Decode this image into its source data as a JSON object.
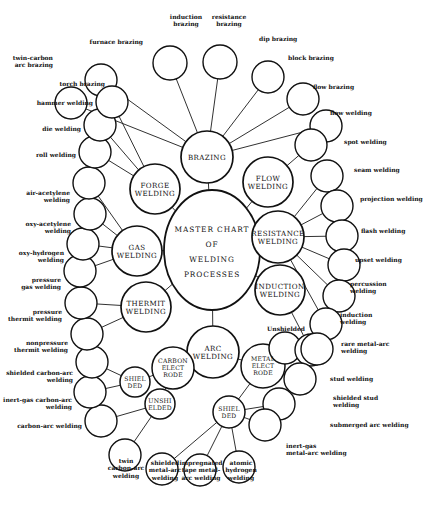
{
  "diagram": {
    "type": "radial-node-link",
    "background_color": "#ffffff",
    "line_color": "#111111",
    "text_color": "#111111"
  },
  "center": {
    "id": "center",
    "lines": [
      "MASTER CHART",
      "OF",
      "WELDING",
      "PROCESSES"
    ],
    "x": 212,
    "y": 250,
    "rx": 48,
    "ry": 60
  },
  "hubs": [
    {
      "id": "brazing",
      "lines": [
        "BRAZING"
      ],
      "x": 207,
      "y": 157,
      "r": 26
    },
    {
      "id": "flow",
      "lines": [
        "FLOW",
        "WELDING"
      ],
      "x": 268,
      "y": 182,
      "r": 25
    },
    {
      "id": "resistance",
      "lines": [
        "RESISTANCE",
        "WELDING"
      ],
      "x": 278,
      "y": 237,
      "r": 26
    },
    {
      "id": "induction",
      "lines": [
        "INDUCTION",
        "WELDING"
      ],
      "x": 280,
      "y": 290,
      "r": 25
    },
    {
      "id": "arc",
      "lines": [
        "ARC",
        "WELDING"
      ],
      "x": 213,
      "y": 352,
      "r": 26
    },
    {
      "id": "thermit",
      "lines": [
        "THERMIT",
        "WELDING"
      ],
      "x": 146,
      "y": 307,
      "r": 25
    },
    {
      "id": "gas",
      "lines": [
        "GAS",
        "WELDING"
      ],
      "x": 137,
      "y": 251,
      "r": 25
    },
    {
      "id": "forge",
      "lines": [
        "FORGE",
        "WELDING"
      ],
      "x": 155,
      "y": 189,
      "r": 25
    }
  ],
  "sub_hubs": [
    {
      "id": "carbon-electrode",
      "lines": [
        "CARBON",
        "ELECT",
        "RODE"
      ],
      "x": 173,
      "y": 368,
      "r": 21
    },
    {
      "id": "metal-electrode",
      "lines": [
        "METAL",
        "ELECT",
        "RODE"
      ],
      "x": 263,
      "y": 366,
      "r": 22
    },
    {
      "id": "shielded-carbon",
      "lines": [
        "SHIEL",
        "DED"
      ],
      "x": 135,
      "y": 382,
      "r": 15
    },
    {
      "id": "unshielded-carbon",
      "lines": [
        "UNSHI",
        "ELDED"
      ],
      "x": 160,
      "y": 404,
      "r": 15
    },
    {
      "id": "shielded-metal",
      "lines": [
        "SHIEL",
        "DED"
      ],
      "x": 229,
      "y": 412,
      "r": 16
    },
    {
      "id": "unshielded-metal",
      "lines": [],
      "x": 285,
      "y": 348,
      "r": 16,
      "label": "Unshielded",
      "label_x": 286,
      "label_y": 331
    }
  ],
  "leaves": [
    {
      "id": "twin-carbon-arc-brazing",
      "label": "twin-carbon\narc brazing",
      "x": 71,
      "y": 103,
      "r": 16,
      "parent": "brazing",
      "side": "r",
      "lx": 53,
      "ly": 60
    },
    {
      "id": "furnace-brazing",
      "label": "furnace brazing",
      "x": 101,
      "y": 80,
      "r": 16,
      "parent": "brazing",
      "side": "r",
      "lx": 143,
      "ly": 44
    },
    {
      "id": "induction-brazing",
      "label": "induction\nbrazing",
      "x": 170,
      "y": 63,
      "r": 17,
      "parent": "brazing",
      "side": "c",
      "lx": 186,
      "ly": 19
    },
    {
      "id": "resistance-brazing",
      "label": "resistance\nbrazing",
      "x": 220,
      "y": 62,
      "r": 17,
      "parent": "brazing",
      "side": "c",
      "lx": 229,
      "ly": 19
    },
    {
      "id": "dip-brazing",
      "label": "dip brazing",
      "x": 268,
      "y": 77,
      "r": 16,
      "parent": "brazing",
      "side": "l",
      "lx": 259,
      "ly": 41
    },
    {
      "id": "block-brazing",
      "label": "block brazing",
      "x": 303,
      "y": 99,
      "r": 16,
      "parent": "brazing",
      "side": "l",
      "lx": 288,
      "ly": 60
    },
    {
      "id": "flow-brazing",
      "label": "flow brazing",
      "x": 326,
      "y": 126,
      "r": 16,
      "parent": "brazing",
      "side": "l",
      "lx": 313,
      "ly": 89
    },
    {
      "id": "flow-welding",
      "label": "flow welding",
      "x": 311,
      "y": 145,
      "r": 16,
      "parent": "flow",
      "side": "l",
      "lx": 330,
      "ly": 115
    },
    {
      "id": "spot-welding",
      "label": "spot welding",
      "x": 327,
      "y": 176,
      "r": 16,
      "parent": "resistance",
      "side": "l",
      "lx": 344,
      "ly": 144
    },
    {
      "id": "seam-welding",
      "label": "seam welding",
      "x": 337,
      "y": 206,
      "r": 16,
      "parent": "resistance",
      "side": "l",
      "lx": 354,
      "ly": 172
    },
    {
      "id": "projection-welding",
      "label": "projection welding",
      "x": 342,
      "y": 236,
      "r": 16,
      "parent": "resistance",
      "side": "l",
      "lx": 360,
      "ly": 201
    },
    {
      "id": "flash-welding",
      "label": "flash welding",
      "x": 344,
      "y": 265,
      "r": 16,
      "parent": "resistance",
      "side": "l",
      "lx": 361,
      "ly": 233
    },
    {
      "id": "upset-welding",
      "label": "upset welding",
      "x": 339,
      "y": 296,
      "r": 16,
      "parent": "resistance",
      "side": "l",
      "lx": 355,
      "ly": 262
    },
    {
      "id": "percussion-welding",
      "label": "percussion\nwelding",
      "x": 326,
      "y": 324,
      "r": 16,
      "parent": "resistance",
      "side": "l",
      "lx": 350,
      "ly": 286
    },
    {
      "id": "induction-welding",
      "label": "induction\nwelding",
      "x": 311,
      "y": 350,
      "r": 16,
      "parent": "induction",
      "side": "l",
      "lx": 340,
      "ly": 317
    },
    {
      "id": "rare-metal-arc-welding",
      "label": "rare metal-arc\nwelding",
      "x": 317,
      "y": 349,
      "r": 16,
      "parent": "unshielded-metal",
      "side": "l",
      "lx": 341,
      "ly": 346
    },
    {
      "id": "stud-welding",
      "label": "stud welding",
      "x": 300,
      "y": 379,
      "r": 16,
      "parent": "metal-electrode",
      "side": "l",
      "lx": 330,
      "ly": 381
    },
    {
      "id": "shielded-stud-welding",
      "label": "shielded stud\nwelding",
      "x": 279,
      "y": 404,
      "r": 16,
      "parent": "shielded-metal",
      "side": "l",
      "lx": 333,
      "ly": 400
    },
    {
      "id": "submerged-arc-welding",
      "label": "submerged arc welding",
      "x": 265,
      "y": 425,
      "r": 16,
      "parent": "shielded-metal",
      "side": "l",
      "lx": 330,
      "ly": 427
    },
    {
      "id": "inert-gas-metal-arc",
      "label": "inert-gas\nmetal-arc welding",
      "x": 270,
      "y": 436,
      "r": 0,
      "parent": "shielded-metal",
      "side": "l",
      "lx": 286,
      "ly": 448
    },
    {
      "id": "atomic-hydrogen-welding",
      "label": "atomic\nhydrogen\nwelding",
      "x": 239,
      "y": 467,
      "r": 16,
      "parent": "shielded-metal",
      "side": "c",
      "lx": 241,
      "ly": 465
    },
    {
      "id": "impregnated-tape",
      "label": "impregnated\ntape metal-\narc welding",
      "x": 200,
      "y": 470,
      "r": 16,
      "parent": "shielded-metal",
      "side": "c",
      "lx": 201,
      "ly": 465
    },
    {
      "id": "shielded-metal-arc",
      "label": "shielded\nmetal-arc\nwelding",
      "x": 162,
      "y": 469,
      "r": 16,
      "parent": "shielded-metal",
      "side": "c",
      "lx": 165,
      "ly": 465
    },
    {
      "id": "twin-carbon-arc-welding",
      "label": "twin\ncarbon-arc\nwelding",
      "x": 125,
      "y": 455,
      "r": 16,
      "parent": "unshielded-carbon",
      "side": "c",
      "lx": 126,
      "ly": 463
    },
    {
      "id": "carbon-arc-welding",
      "label": "carbon-arc welding",
      "x": 101,
      "y": 421,
      "r": 16,
      "parent": "unshielded-carbon",
      "side": "r",
      "lx": 82,
      "ly": 428
    },
    {
      "id": "inert-gas-carbon-arc",
      "label": "inert-gas carbon-arc\nwelding",
      "x": 90,
      "y": 392,
      "r": 16,
      "parent": "shielded-carbon",
      "side": "r",
      "lx": 72,
      "ly": 402
    },
    {
      "id": "shielded-carbon-arc",
      "label": "shielded carbon-arc\nwelding",
      "x": 92,
      "y": 362,
      "r": 16,
      "parent": "shielded-carbon",
      "side": "r",
      "lx": 73,
      "ly": 375
    },
    {
      "id": "nonpressure-thermit",
      "label": "nonpressure\nthermit welding",
      "x": 87,
      "y": 334,
      "r": 16,
      "parent": "thermit",
      "side": "r",
      "lx": 68,
      "ly": 345
    },
    {
      "id": "pressure-thermit",
      "label": "pressure\nthermit welding",
      "x": 81,
      "y": 303,
      "r": 16,
      "parent": "thermit",
      "side": "r",
      "lx": 62,
      "ly": 314
    },
    {
      "id": "pressure-gas-welding",
      "label": "pressure\ngas welding",
      "x": 80,
      "y": 271,
      "r": 16,
      "parent": "gas",
      "side": "r",
      "lx": 61,
      "ly": 282
    },
    {
      "id": "oxy-hydrogen-welding",
      "label": "oxy-hydrogen\nwelding",
      "x": 83,
      "y": 244,
      "r": 16,
      "parent": "gas",
      "side": "r",
      "lx": 64,
      "ly": 255
    },
    {
      "id": "oxy-acetylene-welding",
      "label": "oxy-acetylene\nwelding",
      "x": 90,
      "y": 214,
      "r": 16,
      "parent": "gas",
      "side": "r",
      "lx": 71,
      "ly": 226
    },
    {
      "id": "air-acetylene-welding",
      "label": "air-acetylene\nwelding",
      "x": 89,
      "y": 183,
      "r": 16,
      "parent": "gas",
      "side": "r",
      "lx": 70,
      "ly": 195
    },
    {
      "id": "roll-welding",
      "label": "roll welding",
      "x": 95,
      "y": 152,
      "r": 16,
      "parent": "forge",
      "side": "r",
      "lx": 76,
      "ly": 157
    },
    {
      "id": "die-welding",
      "label": "die welding",
      "x": 100,
      "y": 125,
      "r": 16,
      "parent": "forge",
      "side": "r",
      "lx": 81,
      "ly": 131
    },
    {
      "id": "hammer-welding",
      "label": "hammer welding",
      "x": 112,
      "y": 102,
      "r": 16,
      "parent": "forge",
      "side": "r",
      "lx": 93,
      "ly": 105
    },
    {
      "id": "torch-brazing",
      "label": "torch brazing",
      "x": 110,
      "y": 78,
      "r": 0,
      "parent": "brazing",
      "side": "r",
      "lx": 105,
      "ly": 86
    }
  ],
  "edges": [
    [
      "center",
      "brazing"
    ],
    [
      "center",
      "flow"
    ],
    [
      "center",
      "resistance"
    ],
    [
      "center",
      "induction"
    ],
    [
      "center",
      "arc"
    ],
    [
      "center",
      "thermit"
    ],
    [
      "center",
      "gas"
    ],
    [
      "center",
      "forge"
    ],
    [
      "arc",
      "carbon-electrode"
    ],
    [
      "arc",
      "metal-electrode"
    ],
    [
      "carbon-electrode",
      "shielded-carbon"
    ],
    [
      "carbon-electrode",
      "unshielded-carbon"
    ],
    [
      "metal-electrode",
      "shielded-metal"
    ],
    [
      "metal-electrode",
      "unshielded-metal"
    ]
  ]
}
